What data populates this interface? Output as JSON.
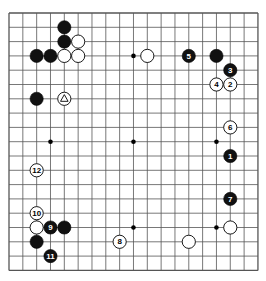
{
  "board": {
    "size": 19,
    "origin_x": 9,
    "origin_y": 13,
    "spacing_x": 13.83,
    "spacing_y": 14.3,
    "stone_radius": 6.6,
    "line_color": "#555555",
    "black_color": "#111111",
    "white_color": "#ffffff",
    "star_points": [
      [
        3,
        3
      ],
      [
        9,
        3
      ],
      [
        15,
        3
      ],
      [
        3,
        9
      ],
      [
        9,
        9
      ],
      [
        15,
        9
      ],
      [
        3,
        15
      ],
      [
        9,
        15
      ],
      [
        15,
        15
      ]
    ]
  },
  "stones": [
    {
      "color": "black",
      "col": 4,
      "row": 1,
      "label": ""
    },
    {
      "color": "black",
      "col": 4,
      "row": 2,
      "label": ""
    },
    {
      "color": "white",
      "col": 5,
      "row": 2,
      "label": ""
    },
    {
      "color": "black",
      "col": 2,
      "row": 3,
      "label": ""
    },
    {
      "color": "black",
      "col": 3,
      "row": 3,
      "label": ""
    },
    {
      "color": "white",
      "col": 4,
      "row": 3,
      "label": ""
    },
    {
      "color": "white",
      "col": 5,
      "row": 3,
      "label": ""
    },
    {
      "color": "black",
      "col": 2,
      "row": 6,
      "label": ""
    },
    {
      "color": "white",
      "col": 4,
      "row": 6,
      "label": "",
      "marker": "triangle"
    },
    {
      "color": "white",
      "col": 10,
      "row": 3,
      "label": ""
    },
    {
      "color": "black",
      "col": 13,
      "row": 3,
      "label": "5"
    },
    {
      "color": "black",
      "col": 15,
      "row": 3,
      "label": ""
    },
    {
      "color": "black",
      "col": 16,
      "row": 4,
      "label": "3"
    },
    {
      "color": "white",
      "col": 15,
      "row": 5,
      "label": "4"
    },
    {
      "color": "white",
      "col": 16,
      "row": 5,
      "label": "2"
    },
    {
      "color": "white",
      "col": 16,
      "row": 8,
      "label": "6"
    },
    {
      "color": "black",
      "col": 16,
      "row": 10,
      "label": "1"
    },
    {
      "color": "black",
      "col": 16,
      "row": 13,
      "label": "7"
    },
    {
      "color": "white",
      "col": 16,
      "row": 15,
      "label": ""
    },
    {
      "color": "white",
      "col": 13,
      "row": 16,
      "label": ""
    },
    {
      "color": "white",
      "col": 2,
      "row": 11,
      "label": "12"
    },
    {
      "color": "white",
      "col": 2,
      "row": 14,
      "label": "10"
    },
    {
      "color": "white",
      "col": 2,
      "row": 15,
      "label": ""
    },
    {
      "color": "black",
      "col": 3,
      "row": 15,
      "label": "9"
    },
    {
      "color": "black",
      "col": 4,
      "row": 15,
      "label": ""
    },
    {
      "color": "black",
      "col": 2,
      "row": 16,
      "label": ""
    },
    {
      "color": "black",
      "col": 3,
      "row": 17,
      "label": "11"
    },
    {
      "color": "white",
      "col": 8,
      "row": 16,
      "label": "8"
    }
  ]
}
